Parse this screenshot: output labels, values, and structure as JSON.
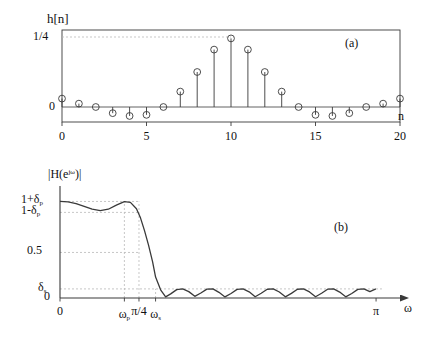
{
  "figure": {
    "background": "#ffffff",
    "ink": "#3a3a3a",
    "grid_color": "#b9b9b9"
  },
  "panel_a": {
    "tag": "(a)",
    "ytitle": "h[n]",
    "xlabel": "n",
    "yticks": [
      {
        "value": 0.25,
        "label": "1/4"
      },
      {
        "value": 0.0,
        "label": "0"
      }
    ],
    "xticks": [
      {
        "value": 0,
        "label": "0"
      },
      {
        "value": 5,
        "label": "5"
      },
      {
        "value": 10,
        "label": "10"
      },
      {
        "value": 15,
        "label": "15"
      },
      {
        "value": 20,
        "label": "20"
      }
    ],
    "dashed_level": 0.25
  },
  "panel_b": {
    "tag": "(b)",
    "ytitle": "|H(e",
    "ytitle_sup": "jω",
    "ytitle_end": ")|",
    "xlabel": "ω",
    "yticks": [
      {
        "value": 1.06,
        "label": "1+δ",
        "sub": "p"
      },
      {
        "value": 0.94,
        "label": "1-δ",
        "sub": "p"
      },
      {
        "value": 0.5,
        "label": "0.5",
        "sub": ""
      },
      {
        "value": 0.1,
        "label": "δ",
        "sub": "s"
      },
      {
        "value": 0.0,
        "label": "0",
        "sub": ""
      }
    ],
    "xticks": [
      {
        "value": 0.0,
        "label": "0",
        "sub": ""
      },
      {
        "value": 0.64,
        "label": "ω",
        "sub": "p"
      },
      {
        "value": 0.785,
        "label": "π/4",
        "sub": ""
      },
      {
        "value": 0.95,
        "label": "ω",
        "sub": "s"
      },
      {
        "value": 3.14159,
        "label": "π",
        "sub": ""
      }
    ]
  },
  "chart_data": [
    {
      "type": "stem",
      "title": "h[n]",
      "xlabel": "n",
      "ylabel": "h[n]",
      "xlim": [
        -0.6,
        20.6
      ],
      "ylim": [
        -0.075,
        0.3
      ],
      "grid": false,
      "x": [
        0,
        1,
        2,
        3,
        4,
        5,
        6,
        7,
        8,
        9,
        10,
        11,
        12,
        13,
        14,
        15,
        16,
        17,
        18,
        19,
        20
      ],
      "values": [
        0.03,
        0.012,
        0.0,
        -0.022,
        -0.032,
        -0.028,
        0.0,
        0.055,
        0.125,
        0.205,
        0.245,
        0.205,
        0.125,
        0.055,
        0.0,
        -0.028,
        -0.032,
        -0.022,
        0.0,
        0.012,
        0.03
      ],
      "marker": "open-circle",
      "annotations": [
        {
          "text": "1/4",
          "type": "ytick-dashed",
          "value": 0.25
        },
        {
          "text": "(a)",
          "type": "panel-tag"
        }
      ]
    },
    {
      "type": "line",
      "title": "|H(e^{jω})|",
      "xlabel": "ω",
      "ylabel": "|H(e^{jω})|",
      "xlim": [
        0,
        3.3
      ],
      "ylim": [
        -0.02,
        1.18
      ],
      "grid": false,
      "series": [
        {
          "name": "magnitude response",
          "x": [
            0.0,
            0.08,
            0.16,
            0.24,
            0.32,
            0.4,
            0.48,
            0.56,
            0.64,
            0.7,
            0.76,
            0.8,
            0.84,
            0.88,
            0.92,
            0.95,
            1.0,
            1.05,
            1.1,
            1.16,
            1.22,
            1.28,
            1.34,
            1.4,
            1.46,
            1.52,
            1.58,
            1.64,
            1.7,
            1.76,
            1.82,
            1.88,
            1.94,
            2.0,
            2.06,
            2.12,
            2.18,
            2.24,
            2.3,
            2.36,
            2.42,
            2.48,
            2.54,
            2.6,
            2.66,
            2.72,
            2.78,
            2.84,
            2.9,
            2.96,
            3.02,
            3.08,
            3.14
          ],
          "y": [
            1.06,
            1.055,
            1.035,
            1.005,
            0.975,
            0.96,
            0.975,
            1.02,
            1.058,
            1.05,
            0.98,
            0.88,
            0.74,
            0.58,
            0.4,
            0.23,
            0.09,
            0.012,
            0.045,
            0.092,
            0.1,
            0.07,
            0.018,
            0.055,
            0.098,
            0.1,
            0.062,
            0.012,
            0.05,
            0.095,
            0.1,
            0.068,
            0.014,
            0.052,
            0.096,
            0.1,
            0.066,
            0.013,
            0.051,
            0.096,
            0.1,
            0.067,
            0.014,
            0.052,
            0.097,
            0.1,
            0.065,
            0.013,
            0.05,
            0.095,
            0.1,
            0.07,
            0.1
          ]
        }
      ],
      "reference_lines": [
        {
          "label": "1+δp",
          "value": 1.06,
          "axis": "y",
          "style": "dashed"
        },
        {
          "label": "1-δp",
          "value": 0.94,
          "axis": "y",
          "style": "dashed"
        },
        {
          "label": "0.5",
          "value": 0.5,
          "axis": "y",
          "style": "dashed"
        },
        {
          "label": "δs",
          "value": 0.1,
          "axis": "y",
          "style": "dashed"
        },
        {
          "label": "ωp",
          "value": 0.64,
          "axis": "x",
          "style": "dashed"
        },
        {
          "label": "π/4",
          "value": 0.785,
          "axis": "x",
          "style": "dashed"
        },
        {
          "label": "ωs",
          "value": 0.95,
          "axis": "x",
          "style": "dashed"
        }
      ],
      "annotations": [
        {
          "text": "(b)",
          "type": "panel-tag"
        }
      ]
    }
  ]
}
